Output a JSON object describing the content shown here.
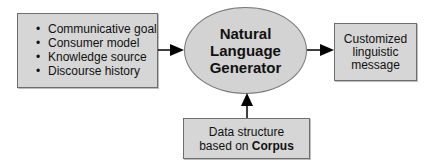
{
  "diagram": {
    "inputs": {
      "items": [
        "Communicative goal",
        "Consumer model",
        "Knowledge source",
        "Discourse history"
      ]
    },
    "generator": {
      "line1": "Natural",
      "line2": "Language",
      "line3": "Generator"
    },
    "output": {
      "line1": "Customized",
      "line2": "linguistic",
      "line3": "message"
    },
    "corpus": {
      "line1": "Data structure",
      "line2_prefix": "based on ",
      "line2_bold": "Corpus"
    },
    "edges": [
      {
        "from": "inputs",
        "to": "generator"
      },
      {
        "from": "generator",
        "to": "output"
      },
      {
        "from": "corpus",
        "to": "generator"
      }
    ],
    "colors": {
      "node_fill": "#d6d6d6",
      "node_border": "#6e6e6e",
      "arrow": "#000000"
    }
  }
}
